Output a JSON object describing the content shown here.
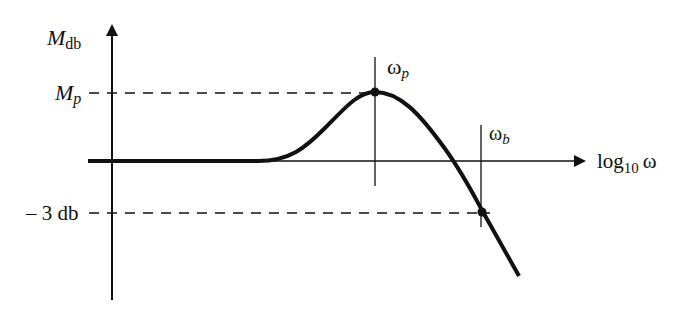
{
  "diagram": {
    "type": "frequency-response",
    "y_axis": {
      "label_main": "M",
      "label_sub": "db"
    },
    "x_axis": {
      "label_main": "log",
      "label_sub": "10",
      "label_var": "ω"
    },
    "levels": {
      "peak": {
        "label_main": "M",
        "label_sub": "p"
      },
      "cutoff": {
        "label": "– 3 db"
      }
    },
    "markers": {
      "peak_freq": {
        "label_main": "ω",
        "label_sub": "p"
      },
      "bandwidth": {
        "label_main": "ω",
        "label_sub": "b"
      }
    },
    "colors": {
      "ink": "#111111",
      "background": "#ffffff"
    }
  }
}
